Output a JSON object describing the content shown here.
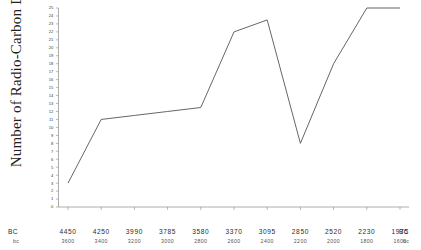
{
  "chart_data": {
    "type": "line",
    "title": "",
    "xlabel": "",
    "ylabel": "Number of Radio-Carbon Dates",
    "ylim": [
      0,
      25
    ],
    "grid": false,
    "legend": null,
    "x_axis_primary_label": "BC",
    "x_axis_secondary_label": "bc",
    "x_axis_primary_end_label": "BC",
    "x_axis_secondary_end_label": "bc",
    "categories": [
      "4450",
      "4250",
      "3990",
      "3785",
      "3580",
      "3370",
      "3095",
      "2850",
      "2520",
      "2230",
      "1975"
    ],
    "categories_secondary": [
      "3600",
      "3400",
      "3200",
      "3000",
      "2800",
      "2600",
      "2400",
      "2200",
      "2000",
      "1800",
      "1600"
    ],
    "values": [
      3,
      11,
      11.5,
      12,
      12.5,
      22,
      23.5,
      8,
      18,
      25,
      25
    ],
    "ytick_labels": [
      "0",
      "1",
      "2",
      "3",
      "4",
      "5",
      "6",
      "7",
      "8",
      "9",
      "10",
      "11",
      "12",
      "13",
      "14",
      "15",
      "16",
      "17",
      "18",
      "19",
      "20",
      "21",
      "22",
      "23",
      "24",
      "25"
    ]
  }
}
